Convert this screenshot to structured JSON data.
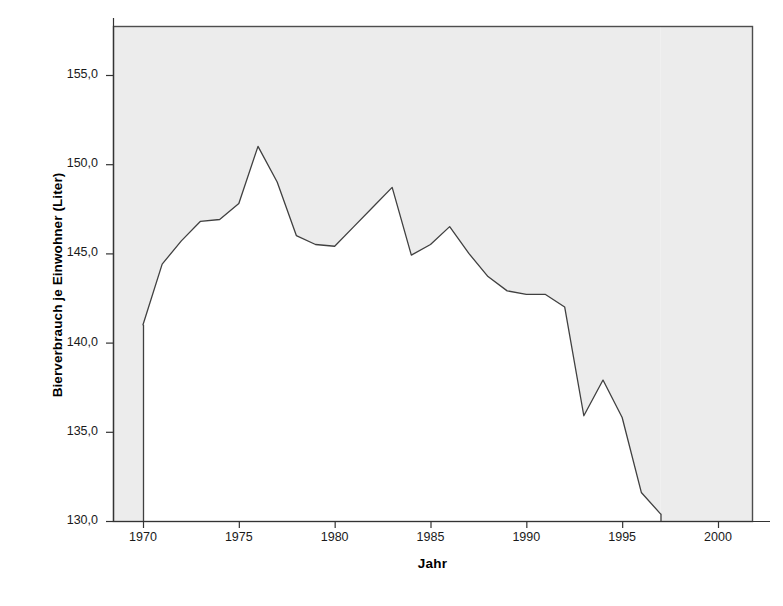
{
  "chart_data": {
    "type": "line",
    "title": "",
    "xlabel": "Jahr",
    "ylabel": "Bierverbrauch je Einwohner (Liter)",
    "xlim": [
      1968.5,
      2001.5
    ],
    "ylim": [
      130.0,
      157.5
    ],
    "grid": false,
    "legend": false,
    "xtick_labels": [
      "1970",
      "1975",
      "1980",
      "1985",
      "1990",
      "1995",
      "2000"
    ],
    "xticks": [
      1970,
      1975,
      1980,
      1985,
      1990,
      1995,
      2000
    ],
    "ytick_labels": [
      "130,0",
      "135,0",
      "140,0",
      "145,0",
      "150,0",
      "155,0"
    ],
    "yticks": [
      130.0,
      135.0,
      140.0,
      145.0,
      150.0,
      155.0
    ],
    "line_color": "#404040",
    "plot_background": "#ffffff",
    "figure_background": "#ffffff",
    "shaded_margin_color": "#ececec",
    "frame_color": "#4d4d4d",
    "x": [
      1970,
      1971,
      1972,
      1973,
      1974,
      1975,
      1976,
      1977,
      1978,
      1979,
      1980,
      1981,
      1982,
      1983,
      1984,
      1985,
      1986,
      1987,
      1988,
      1989,
      1990,
      1991,
      1992,
      1993,
      1994,
      1995,
      1996,
      1997
    ],
    "values": [
      141.0,
      144.4,
      145.7,
      146.8,
      146.9,
      147.8,
      151.0,
      149.0,
      146.0,
      145.5,
      145.4,
      146.5,
      147.6,
      148.7,
      144.9,
      145.5,
      146.5,
      145.0,
      143.7,
      142.9,
      142.7,
      142.7,
      142.0,
      135.9,
      137.9,
      135.8,
      131.6,
      130.4
    ],
    "series": [
      {
        "name": "Bierverbrauch je Einwohner (Liter)",
        "values": [
          141.0,
          144.4,
          145.7,
          146.8,
          146.9,
          147.8,
          151.0,
          149.0,
          146.0,
          145.5,
          145.4,
          146.5,
          147.6,
          148.7,
          144.9,
          145.5,
          146.5,
          145.0,
          143.7,
          142.9,
          142.7,
          142.7,
          142.0,
          135.9,
          137.9,
          135.8,
          131.6,
          130.4
        ]
      }
    ]
  }
}
